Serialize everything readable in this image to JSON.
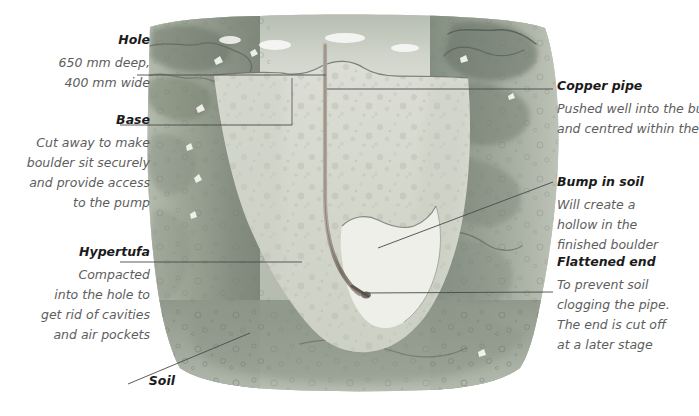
{
  "figure": {
    "colors": {
      "soil_light": "#c9cec4",
      "soil_mid": "#9aa396",
      "soil_dark": "#7d867b",
      "hypertufa": "#d9dbd2",
      "bump": "#eceee7",
      "pipe": "#8e8478",
      "leader": "#4a4a4a",
      "heading_text": "#1b1b1b",
      "body_text": "#5d5d5d",
      "background": "#ffffff"
    }
  },
  "annotations": {
    "hole": {
      "heading": "Hole",
      "lines": [
        "650 mm deep,",
        "400 mm wide"
      ]
    },
    "base": {
      "heading": "Base",
      "lines": [
        "Cut away to make",
        "boulder sit securely",
        "and provide access",
        "to the pump"
      ]
    },
    "hypertufa": {
      "heading": "Hypertufa",
      "lines": [
        "Compacted",
        "into the hole to",
        "get rid of cavities",
        "and air pockets"
      ]
    },
    "soil": {
      "heading": "Soil",
      "lines": []
    },
    "copper_pipe": {
      "heading": "Copper pipe",
      "lines": [
        "Pushed well into the bump",
        "and centred within the hole"
      ]
    },
    "bump_in_soil": {
      "heading": "Bump in soil",
      "lines": [
        "Will create a",
        "hollow in the",
        "finished boulder"
      ]
    },
    "flattened_end": {
      "heading": "Flattened end",
      "lines": [
        "To prevent soil",
        "clogging the pipe.",
        "The end is cut off",
        "at a later stage"
      ]
    }
  }
}
